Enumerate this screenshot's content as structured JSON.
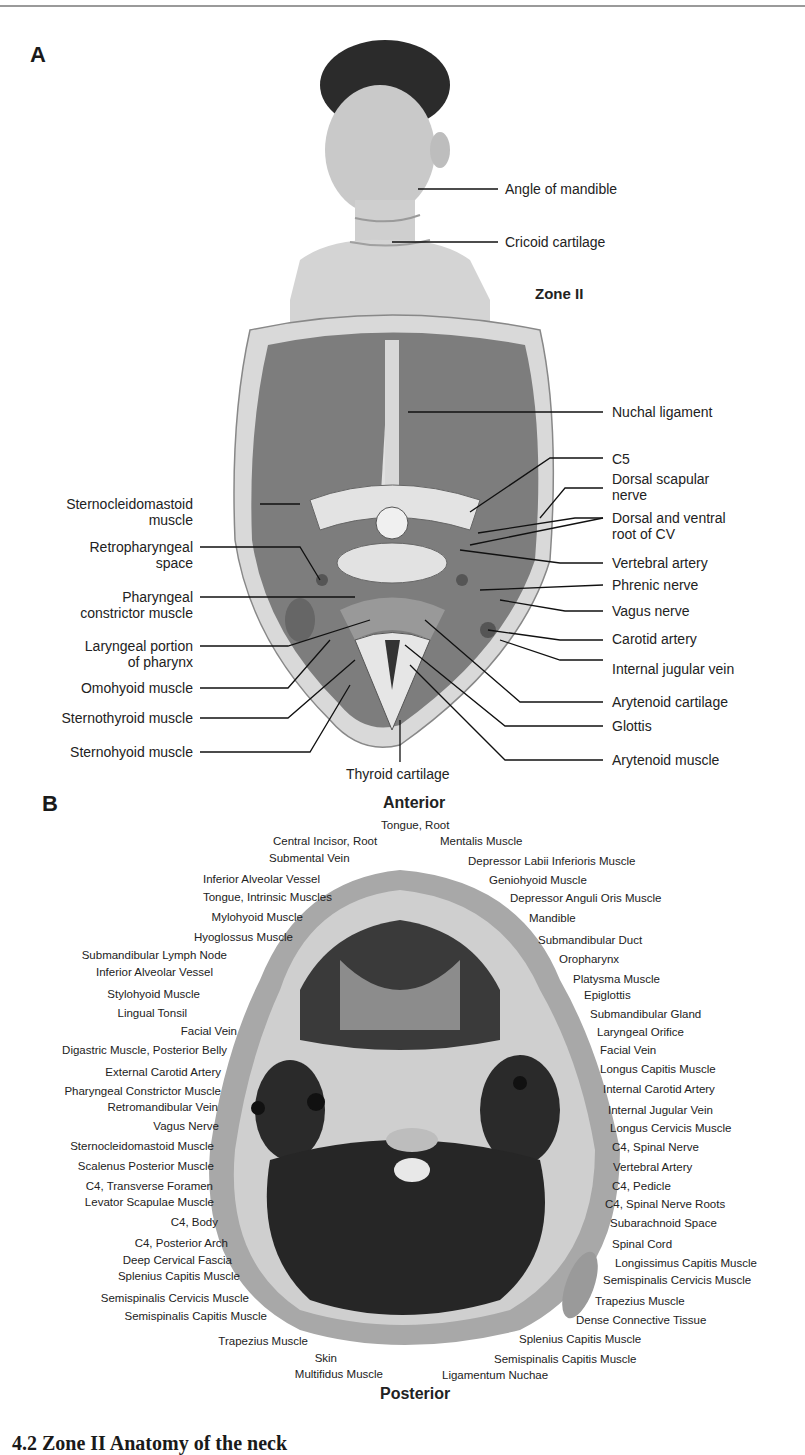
{
  "panel_a": {
    "letter": "A",
    "zone_label": "Zone II",
    "labels_right_top": [
      "Angle of mandible",
      "Cricoid cartilage"
    ],
    "labels_right": [
      "Nuchal ligament",
      "C5",
      "Dorsal scapular\nnerve",
      "Dorsal and ventral\nroot of CV",
      "Vertebral artery",
      "Phrenic nerve",
      "Vagus nerve",
      "Carotid artery",
      "Internal jugular vein",
      "Arytenoid cartilage",
      "Glottis",
      "Arytenoid muscle"
    ],
    "labels_left": [
      "Sternocleidomastoid\nmuscle",
      "Retropharyngeal\nspace",
      "Pharyngeal\nconstrictor muscle",
      "Laryngeal portion\nof pharynx",
      "Omohyoid muscle",
      "Sternothyroid muscle",
      "Sternohyoid muscle"
    ],
    "label_bottom": "Thyroid cartilage"
  },
  "panel_b": {
    "letter": "B",
    "orientation_top": "Anterior",
    "orientation_bottom": "Posterior",
    "labels_top": [
      "Tongue, Root",
      "Central Incisor, Root",
      "Mentalis Muscle",
      "Submental Vein"
    ],
    "labels_left": [
      "Inferior Alveolar Vessel",
      "Tongue, Intrinsic Muscles",
      "Mylohyoid Muscle",
      "Hyoglossus Muscle",
      "Submandibular Lymph Node",
      "Inferior Alveolar Vessel",
      "Stylohyoid Muscle",
      "Lingual Tonsil",
      "Facial Vein",
      "Digastric Muscle, Posterior Belly",
      "External Carotid Artery",
      "Pharyngeal Constrictor Muscle",
      "Retromandibular Vein",
      "Vagus Nerve",
      "Sternocleidomastoid Muscle",
      "Scalenus Posterior Muscle",
      "C4, Transverse Foramen",
      "Levator Scapulae Muscle",
      "C4, Body",
      "C4, Posterior Arch",
      "Deep Cervical Fascia",
      "Splenius Capitis Muscle",
      "Semispinalis Cervicis Muscle",
      "Semispinalis Capitis Muscle",
      "Trapezius Muscle",
      "Skin",
      "Multifidus Muscle"
    ],
    "labels_right": [
      "Depressor Labii Inferioris Muscle",
      "Geniohyoid Muscle",
      "Depressor Anguli Oris Muscle",
      "Mandible",
      "Submandibular Duct",
      "Oropharynx",
      "Platysma Muscle",
      "Epiglottis",
      "Submandibular Gland",
      "Laryngeal Orifice",
      "Facial Vein",
      "Longus Capitis Muscle",
      "Internal Carotid Artery",
      "Internal Jugular Vein",
      "Longus Cervicis Muscle",
      "C4, Spinal Nerve",
      "Vertebral Artery",
      "C4, Pedicle",
      "C4, Spinal Nerve Roots",
      "Subarachnoid Space",
      "Spinal Cord",
      "Longissimus Capitis Muscle",
      "Semispinalis Cervicis Muscle",
      "Trapezius Muscle",
      "Dense Connective Tissue",
      "Splenius Capitis Muscle",
      "Semispinalis Capitis Muscle",
      "Ligamentum Nuchae"
    ]
  },
  "caption_partial": "4.2  Zone II Anatomy of the neck"
}
